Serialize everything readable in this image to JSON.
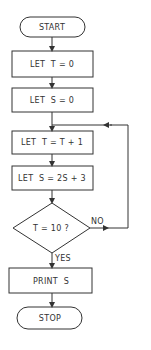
{
  "flowchart": {
    "start": "START",
    "step1": "LET  T = 0",
    "step2": "LET  S = 0",
    "step3": "LET  T = T + 1",
    "step4": "LET  S = 2S + 3",
    "decision": "T = 10 ?",
    "no_label": "NO",
    "yes_label": "YES",
    "output": "PRINT  S",
    "stop": "STOP"
  },
  "colors": {
    "line": "#333333",
    "background": "#ffffff"
  }
}
